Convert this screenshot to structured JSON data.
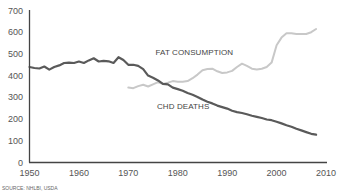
{
  "chart_data": {
    "type": "line",
    "title": "",
    "xlabel": "",
    "ylabel": "",
    "xlim": [
      1950,
      2010
    ],
    "ylim": [
      0,
      700
    ],
    "grid": false,
    "legend": "inline annotations",
    "x_ticks": [
      "1950",
      "1960",
      "1970",
      "1980",
      "1990",
      "2000",
      "2010"
    ],
    "y_ticks": [
      "0",
      "100",
      "200",
      "300",
      "400",
      "500",
      "600",
      "700"
    ],
    "series": [
      {
        "name": "CHD DEATHS",
        "color": "#5a5a5a",
        "x": [
          1950,
          1951,
          1952,
          1953,
          1954,
          1955,
          1956,
          1957,
          1958,
          1959,
          1960,
          1961,
          1962,
          1963,
          1964,
          1965,
          1966,
          1967,
          1968,
          1969,
          1970,
          1971,
          1972,
          1973,
          1974,
          1975,
          1976,
          1977,
          1978,
          1979,
          1980,
          1981,
          1982,
          1983,
          1984,
          1985,
          1986,
          1987,
          1988,
          1989,
          1990,
          1991,
          1992,
          1993,
          1994,
          1995,
          1996,
          1997,
          1998,
          1999,
          2000,
          2001,
          2002,
          2003,
          2004,
          2005,
          2006,
          2007,
          2008
        ],
        "values": [
          440,
          435,
          433,
          442,
          428,
          440,
          447,
          458,
          460,
          458,
          465,
          458,
          470,
          480,
          465,
          468,
          466,
          458,
          485,
          472,
          450,
          450,
          445,
          430,
          400,
          390,
          378,
          362,
          360,
          345,
          338,
          330,
          320,
          312,
          302,
          290,
          280,
          272,
          262,
          255,
          248,
          238,
          232,
          228,
          222,
          215,
          210,
          205,
          198,
          195,
          188,
          180,
          172,
          165,
          155,
          148,
          140,
          132,
          128
        ]
      },
      {
        "name": "FAT CONSUMPTION",
        "color": "#c8c8c8",
        "x": [
          1970,
          1971,
          1972,
          1973,
          1974,
          1975,
          1976,
          1977,
          1978,
          1979,
          1980,
          1981,
          1982,
          1983,
          1984,
          1985,
          1986,
          1987,
          1988,
          1989,
          1990,
          1991,
          1992,
          1993,
          1994,
          1995,
          1996,
          1997,
          1998,
          1999,
          2000,
          2001,
          2002,
          2003,
          2004,
          2005,
          2006,
          2007,
          2008
        ],
        "values": [
          345,
          342,
          352,
          358,
          350,
          360,
          370,
          362,
          368,
          375,
          372,
          372,
          375,
          388,
          405,
          425,
          430,
          432,
          420,
          412,
          415,
          422,
          440,
          455,
          445,
          432,
          428,
          432,
          440,
          460,
          540,
          575,
          595,
          595,
          592,
          592,
          592,
          600,
          615
        ]
      }
    ],
    "annotations": [
      {
        "text": "FAT CONSUMPTION",
        "x": 1975.5,
        "y": 495
      },
      {
        "text": "CHD DEATHS",
        "x": 1975.8,
        "y": 248
      }
    ],
    "source": "SOURCE: NHLBI, USDA"
  }
}
